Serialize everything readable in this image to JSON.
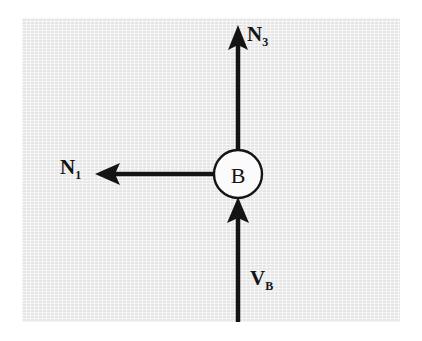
{
  "figure": {
    "panel": {
      "background_color": "#ececec",
      "border_color": "#ffffff"
    },
    "ink_color": "#141414",
    "node": {
      "id": "node-b",
      "label": "B",
      "shape": "circle",
      "fill_color": "#fbfbfb",
      "stroke_color": "#141414",
      "center": {
        "x": 238,
        "y": 174
      },
      "radius": 24
    },
    "arrows": [
      {
        "id": "arrow-n3",
        "label_base": "N",
        "label_sub": "3",
        "direction": "up",
        "from": {
          "x": 238,
          "y": 150
        },
        "to": {
          "x": 238,
          "y": 26
        },
        "head_at": "to"
      },
      {
        "id": "arrow-n1",
        "label_base": "N",
        "label_sub": "1",
        "direction": "left",
        "from": {
          "x": 214,
          "y": 174
        },
        "to": {
          "x": 95,
          "y": 174
        },
        "head_at": "to"
      },
      {
        "id": "arrow-vb",
        "label_base": "V",
        "label_sub": "B",
        "direction": "up",
        "from": {
          "x": 238,
          "y": 322
        },
        "to": {
          "x": 238,
          "y": 199
        },
        "head_at": "to"
      }
    ],
    "labels": {
      "n3": {
        "base": "N",
        "sub": "3"
      },
      "n1": {
        "base": "N",
        "sub": "1"
      },
      "vb": {
        "base": "V",
        "sub": "B"
      }
    }
  }
}
